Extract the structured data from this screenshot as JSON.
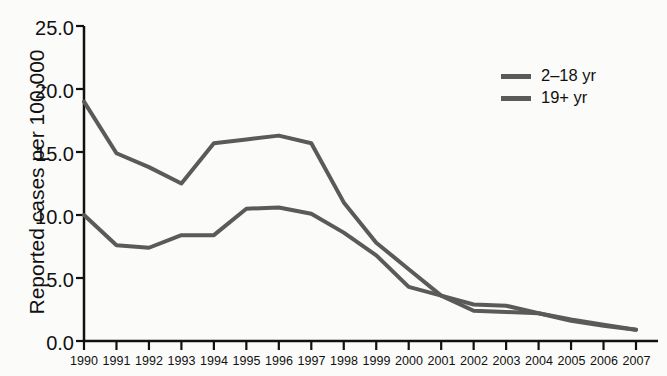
{
  "chart_data": {
    "type": "line",
    "title": "",
    "xlabel": "",
    "ylabel": "Reported cases per 100,000",
    "x": [
      1990,
      1991,
      1992,
      1993,
      1994,
      1995,
      1996,
      1997,
      1998,
      1999,
      2000,
      2001,
      2002,
      2003,
      2004,
      2005,
      2006,
      2007
    ],
    "xtick_labels": [
      "1990",
      "1991",
      "1992",
      "1993",
      "1994",
      "1995",
      "1996",
      "1997",
      "1998",
      "1999",
      "2000",
      "2001",
      "2002",
      "2003",
      "2004",
      "2005",
      "2006",
      "2007"
    ],
    "ytick_labels": [
      "0.0",
      "5.0",
      "10.0",
      "15.0",
      "20.0",
      "25.0"
    ],
    "ytick_values": [
      0,
      5,
      10,
      15,
      20,
      25
    ],
    "ylim": [
      0,
      25
    ],
    "xlim": [
      1990,
      2007
    ],
    "grid": false,
    "legend_position": "top-right",
    "line_color": "#5a5a5a",
    "line_width": 4,
    "series": [
      {
        "name": "2–18 yr",
        "values": [
          19.0,
          14.9,
          13.8,
          12.5,
          15.7,
          16.0,
          16.3,
          15.7,
          11.0,
          7.8,
          5.7,
          3.6,
          2.4,
          2.3,
          2.2,
          1.6,
          1.2,
          0.9
        ]
      },
      {
        "name": "19+ yr",
        "values": [
          10.0,
          7.6,
          7.4,
          8.4,
          8.4,
          10.5,
          10.6,
          10.1,
          8.6,
          6.8,
          4.3,
          3.6,
          2.9,
          2.8,
          2.2,
          1.7,
          1.3,
          0.9
        ]
      }
    ]
  },
  "legend": {
    "entries": [
      {
        "label": "2–18 yr"
      },
      {
        "label": "19+ yr"
      }
    ]
  }
}
